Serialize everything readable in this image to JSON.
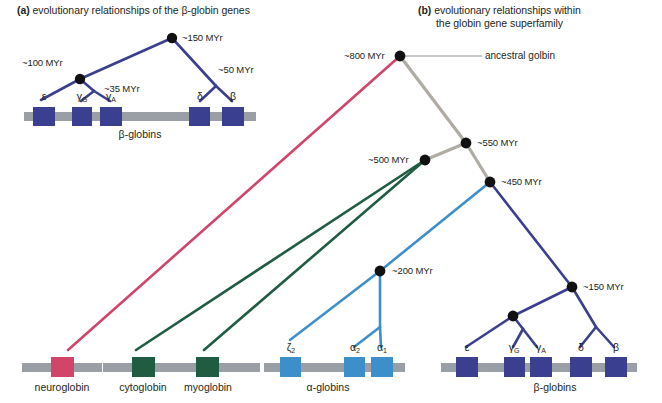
{
  "figure": {
    "width": 662,
    "height": 403,
    "background": "#ffffff"
  },
  "panel_a": {
    "tag": "(a)",
    "title": "evolutionary relationships of the β-globin genes",
    "node_labels": [
      "~150 MYr",
      "~100 MYr",
      "~35 MYr",
      "~50 MYr"
    ],
    "branch_color": "#3b3f8f",
    "gene_box_color": "#3b3f8f",
    "chromosome_color": "#9a9fa6",
    "cluster_label": "β-globins",
    "genes": [
      {
        "label": "ε",
        "sub": ""
      },
      {
        "label": "γ",
        "sub": "G"
      },
      {
        "label": "γ",
        "sub": "A"
      },
      {
        "label": "δ",
        "sub": ""
      },
      {
        "label": "β",
        "sub": ""
      }
    ]
  },
  "panel_b": {
    "tag": "(b)",
    "title_line1": "evolutionary relationships within",
    "title_line2": "the globin gene superfamily",
    "ancestral_label": "ancestral golbin",
    "node_labels": [
      "~800 MYr",
      "~550 MYr",
      "~500 MYr",
      "~450 MYr",
      "~200 MYr",
      "~150 MYr"
    ],
    "colors": {
      "neuroglobin": "#d2456b",
      "cytoglobin_myoglobin": "#1f5c42",
      "ancestral_gray": "#b0aca4",
      "alpha": "#3d8fcc",
      "beta": "#3b3f8f",
      "chromosome": "#9a9fa6"
    },
    "families": [
      {
        "name": "neuroglobin",
        "box_color": "#d2456b"
      },
      {
        "name": "cytoglobin",
        "box_color": "#1f5c42"
      },
      {
        "name": "myoglobin",
        "box_color": "#1f5c42"
      }
    ],
    "alpha_cluster": {
      "label": "α-globins",
      "box_color": "#3d8fcc",
      "genes": [
        {
          "label": "ζ",
          "sub": "2"
        },
        {
          "label": "α",
          "sub": "2"
        },
        {
          "label": "α",
          "sub": "1"
        }
      ]
    },
    "beta_cluster": {
      "label": "β-globins",
      "box_color": "#3b3f8f",
      "genes": [
        {
          "label": "ε",
          "sub": ""
        },
        {
          "label": "γ",
          "sub": "G"
        },
        {
          "label": "γ",
          "sub": "A"
        },
        {
          "label": "δ",
          "sub": ""
        },
        {
          "label": "β",
          "sub": ""
        }
      ]
    }
  }
}
